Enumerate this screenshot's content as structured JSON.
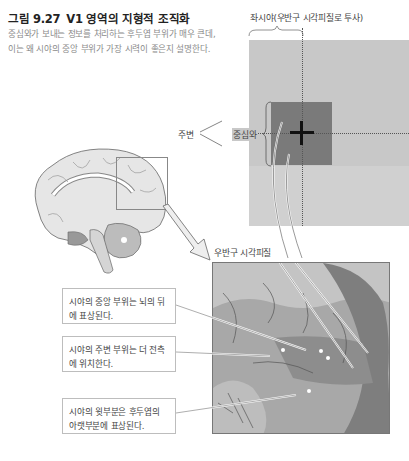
{
  "figure": {
    "number": "그림 9.27",
    "title": "V1 영역의 지형적 조직화",
    "caption": "중심와가 보내는 정보를 처리하는 후두엽 부위가 매우 큰데, 이는 왜 시야의 중앙 부위가 가장 시력이 좋은지 설명한다."
  },
  "visual_field": {
    "heading": "좌시야(우반구 시각피질로 투사)",
    "center_label": "중심와",
    "periphery_label": "주변",
    "colors": {
      "field": "#c8c8c8",
      "center": "#7a7a7a",
      "cross": "#111111"
    }
  },
  "cortex": {
    "heading": "우반구 시각피질"
  },
  "callouts": [
    {
      "text": "시야의 중앙 부위는 뇌의 뒤에 표상된다."
    },
    {
      "text": "시야의 주변 부위는 더 전측에 위치한다."
    },
    {
      "text": "시야의 윗부분은 후두엽의 아랫부분에 표상된다."
    }
  ]
}
